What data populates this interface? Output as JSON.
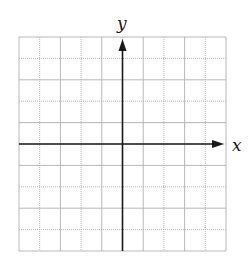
{
  "diagram": {
    "type": "coordinate-grid",
    "grid": {
      "columns": 10,
      "rows": 10,
      "left": 19,
      "top": 37,
      "right": 226,
      "bottom": 251,
      "line_color": "#b8b8b8",
      "minor_style": "dotted"
    },
    "axes": {
      "x_label": "x",
      "y_label": "y",
      "color": "#1a1a1a",
      "x_axis_row": 5,
      "y_axis_col": 5
    }
  }
}
